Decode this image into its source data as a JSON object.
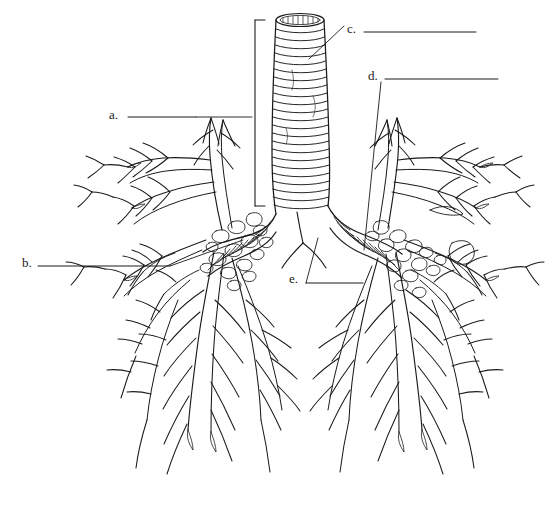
{
  "figure": {
    "kind": "anatomy-line-drawing",
    "background_color": "#ffffff",
    "ink_color": "#1a1a1a",
    "width": 559,
    "height": 519
  },
  "labels": [
    {
      "key": "a",
      "text": "a.",
      "x": 109,
      "y": 108,
      "rule_x1": 128,
      "rule_x2": 196,
      "rule_y": 117
    },
    {
      "key": "b",
      "text": "b.",
      "x": 22,
      "y": 256,
      "rule_x1": 38,
      "rule_x2": 170,
      "rule_y": 266
    },
    {
      "key": "c",
      "text": "c.",
      "x": 347,
      "y": 22,
      "rule_x1": 364,
      "rule_x2": 476,
      "rule_y": 32
    },
    {
      "key": "d",
      "text": "d.",
      "x": 368,
      "y": 69,
      "rule_x1": 385,
      "rule_x2": 498,
      "rule_y": 79
    },
    {
      "key": "e",
      "text": "e.",
      "x": 289,
      "y": 272,
      "rule_x1": 306,
      "rule_x2": 363,
      "rule_y": 283
    }
  ],
  "leaders": [
    {
      "key": "a",
      "points": "196,117 252,117"
    },
    {
      "key": "b",
      "points": "170,266 243,240"
    },
    {
      "key": "c",
      "points": "344,26 309,59"
    },
    {
      "key": "d",
      "points": "381,82 364,250"
    },
    {
      "key": "e",
      "points": "306,283 318,238"
    }
  ],
  "bracket": {
    "x": 255,
    "y_top": 20,
    "y_bottom": 206,
    "tick": 10
  },
  "parts": [
    "trachea",
    "cartilage-rings",
    "carina",
    "right-primary-bronchus",
    "left-primary-bronchus",
    "secondary-bronchi",
    "bronchiole-tree",
    "cartilage-plates"
  ]
}
